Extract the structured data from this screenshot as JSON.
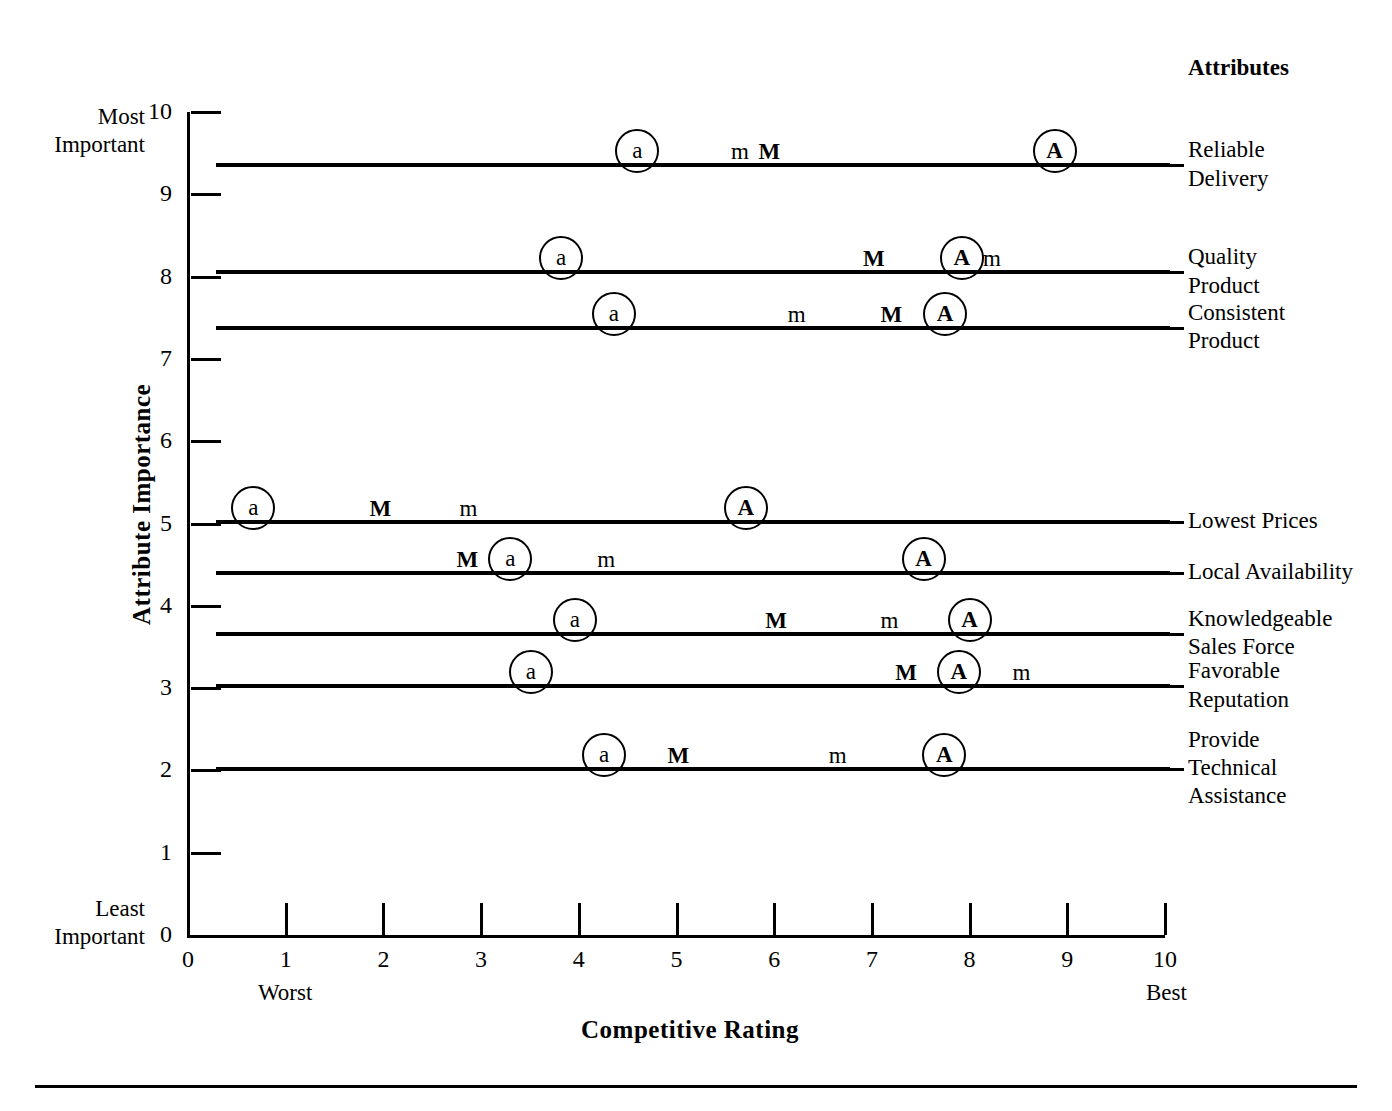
{
  "chart_data": {
    "type": "scatter",
    "title": "",
    "xlabel": "Competitive Rating",
    "ylabel": "Attribute Importance",
    "xlim": [
      0,
      10
    ],
    "ylim": [
      0,
      10
    ],
    "grid": false,
    "legend": "none",
    "x_ticks": [
      "0",
      "1",
      "2",
      "3",
      "4",
      "5",
      "6",
      "7",
      "8",
      "9",
      "10"
    ],
    "y_ticks": [
      "0",
      "1",
      "2",
      "3",
      "4",
      "5",
      "6",
      "7",
      "8",
      "9",
      "10"
    ],
    "x_axis_notes": {
      "left": "Worst",
      "right": "Best"
    },
    "y_axis_notes": {
      "top": "Most\nImportant",
      "bottom": "Least\nImportant"
    },
    "series_legend_keys": [
      "a",
      "m",
      "M",
      "A"
    ],
    "attributes_header": "Attributes",
    "rows": [
      {
        "label": "Reliable\nDelivery",
        "importance": 9.35,
        "markers": [
          {
            "key": "a",
            "rating": 4.6,
            "circled": true
          },
          {
            "key": "m",
            "rating": 5.65,
            "circled": false
          },
          {
            "key": "M",
            "rating": 5.95,
            "circled": false
          },
          {
            "key": "A",
            "rating": 8.87,
            "circled": true
          }
        ]
      },
      {
        "label": "Quality\nProduct",
        "importance": 8.05,
        "markers": [
          {
            "key": "a",
            "rating": 3.82,
            "circled": true
          },
          {
            "key": "M",
            "rating": 7.02,
            "circled": false
          },
          {
            "key": "A",
            "rating": 7.92,
            "circled": true
          },
          {
            "key": "m",
            "rating": 8.23,
            "circled": false
          }
        ]
      },
      {
        "label": "Consistent\nProduct",
        "importance": 7.37,
        "markers": [
          {
            "key": "a",
            "rating": 4.36,
            "circled": true
          },
          {
            "key": "m",
            "rating": 6.23,
            "circled": false
          },
          {
            "key": "M",
            "rating": 7.2,
            "circled": false
          },
          {
            "key": "A",
            "rating": 7.75,
            "circled": true
          }
        ]
      },
      {
        "label": "Lowest Prices",
        "importance": 5.02,
        "markers": [
          {
            "key": "a",
            "rating": 0.67,
            "circled": true
          },
          {
            "key": "M",
            "rating": 1.97,
            "circled": false
          },
          {
            "key": "m",
            "rating": 2.87,
            "circled": false
          },
          {
            "key": "A",
            "rating": 5.71,
            "circled": true
          }
        ]
      },
      {
        "label": "Local Availability",
        "importance": 4.4,
        "markers": [
          {
            "key": "M",
            "rating": 2.86,
            "circled": false
          },
          {
            "key": "a",
            "rating": 3.3,
            "circled": true
          },
          {
            "key": "m",
            "rating": 4.28,
            "circled": false
          },
          {
            "key": "A",
            "rating": 7.53,
            "circled": true
          }
        ]
      },
      {
        "label": "Knowledgeable\nSales Force",
        "importance": 3.66,
        "markers": [
          {
            "key": "a",
            "rating": 3.96,
            "circled": true
          },
          {
            "key": "M",
            "rating": 6.02,
            "circled": false
          },
          {
            "key": "m",
            "rating": 7.18,
            "circled": false
          },
          {
            "key": "A",
            "rating": 8.0,
            "circled": true
          }
        ]
      },
      {
        "label": "Favorable\nReputation",
        "importance": 3.02,
        "markers": [
          {
            "key": "a",
            "rating": 3.51,
            "circled": true
          },
          {
            "key": "M",
            "rating": 7.35,
            "circled": false
          },
          {
            "key": "A",
            "rating": 7.89,
            "circled": true
          },
          {
            "key": "m",
            "rating": 8.53,
            "circled": false
          }
        ]
      },
      {
        "label": "Provide\nTechnical\nAssistance",
        "importance": 2.02,
        "markers": [
          {
            "key": "a",
            "rating": 4.26,
            "circled": true
          },
          {
            "key": "M",
            "rating": 5.02,
            "circled": false
          },
          {
            "key": "m",
            "rating": 6.65,
            "circled": false
          },
          {
            "key": "A",
            "rating": 7.74,
            "circled": true
          }
        ]
      }
    ]
  }
}
